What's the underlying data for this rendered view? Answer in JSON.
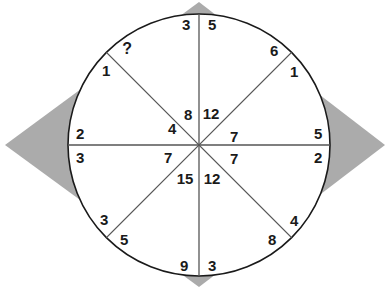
{
  "puzzle": {
    "title": "Circle Sector Number Puzzle",
    "unknown_marker": "?",
    "colors": {
      "background": "#ffffff",
      "diamond_fill": "#ababab",
      "circle_stroke": "#1a1a1a",
      "spoke_stroke": "#4a4a4a",
      "text": "#1a1a1a"
    },
    "geometry": {
      "center_x": 199,
      "center_y": 145,
      "radius": 131,
      "sector_count": 8,
      "diamond_left_tip_x": 5,
      "diamond_right_tip_x": 385,
      "diamond_top_tip_y": 2,
      "diamond_bottom_tip_y": 287
    },
    "outer_labels": [
      {
        "name": "outer-top-left",
        "value": "3",
        "x": 186,
        "y": 24
      },
      {
        "name": "outer-top-right",
        "value": "5",
        "x": 212,
        "y": 24
      },
      {
        "name": "outer-upper-right-above",
        "value": "6",
        "x": 274,
        "y": 50
      },
      {
        "name": "outer-upper-right-below",
        "value": "1",
        "x": 294,
        "y": 71
      },
      {
        "name": "outer-right-above",
        "value": "5",
        "x": 318,
        "y": 133
      },
      {
        "name": "outer-right-below",
        "value": "2",
        "x": 318,
        "y": 157
      },
      {
        "name": "outer-lower-right-above",
        "value": "4",
        "x": 294,
        "y": 220
      },
      {
        "name": "outer-lower-right-below",
        "value": "8",
        "x": 272,
        "y": 239
      },
      {
        "name": "outer-bottom-right",
        "value": "3",
        "x": 212,
        "y": 265
      },
      {
        "name": "outer-bottom-left",
        "value": "9",
        "x": 184,
        "y": 265
      },
      {
        "name": "outer-lower-left-below",
        "value": "5",
        "x": 124,
        "y": 239
      },
      {
        "name": "outer-lower-left-above",
        "value": "3",
        "x": 104,
        "y": 219
      },
      {
        "name": "outer-left-below",
        "value": "3",
        "x": 80,
        "y": 157
      },
      {
        "name": "outer-left-above",
        "value": "2",
        "x": 80,
        "y": 133
      },
      {
        "name": "outer-upper-left-below",
        "value": "1",
        "x": 106,
        "y": 70
      },
      {
        "name": "outer-upper-left-above",
        "value": "?",
        "x": 127,
        "y": 49
      }
    ],
    "inner_labels": [
      {
        "name": "inner-sector-n-ne",
        "value": "12",
        "x": 211,
        "y": 113
      },
      {
        "name": "inner-sector-ne-e",
        "value": "7",
        "x": 234,
        "y": 136
      },
      {
        "name": "inner-sector-e-se",
        "value": "7",
        "x": 234,
        "y": 158
      },
      {
        "name": "inner-sector-se-s",
        "value": "12",
        "x": 212,
        "y": 178
      },
      {
        "name": "inner-sector-s-sw",
        "value": "15",
        "x": 185,
        "y": 178
      },
      {
        "name": "inner-sector-sw-w",
        "value": "7",
        "x": 168,
        "y": 157
      },
      {
        "name": "inner-sector-w-nw",
        "value": "4",
        "x": 172,
        "y": 128
      },
      {
        "name": "inner-sector-nw-n",
        "value": "8",
        "x": 188,
        "y": 114
      }
    ],
    "sectors": [
      {
        "name": "sector-north-northeast",
        "outer_ccw": "5",
        "outer_cw": "6",
        "inner": "12"
      },
      {
        "name": "sector-northeast-east",
        "outer_ccw": "1",
        "outer_cw": "5",
        "inner": "7"
      },
      {
        "name": "sector-east-southeast",
        "outer_ccw": "2",
        "outer_cw": "4",
        "inner": "7"
      },
      {
        "name": "sector-southeast-south",
        "outer_ccw": "8",
        "outer_cw": "3",
        "inner": "12"
      },
      {
        "name": "sector-south-southwest",
        "outer_ccw": "9",
        "outer_cw": "5",
        "inner": "15"
      },
      {
        "name": "sector-southwest-west",
        "outer_ccw": "3",
        "outer_cw": "3",
        "inner": "7"
      },
      {
        "name": "sector-west-northwest",
        "outer_ccw": "2",
        "outer_cw": "1",
        "inner": "4"
      },
      {
        "name": "sector-northwest-north",
        "outer_ccw": "?",
        "outer_cw": "3",
        "inner": "8"
      }
    ]
  }
}
